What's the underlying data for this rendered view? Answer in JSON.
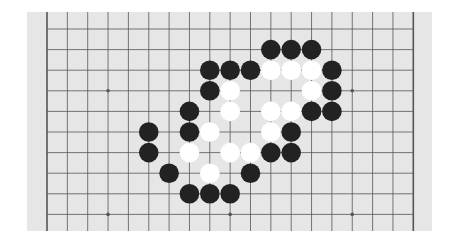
{
  "board": {
    "type": "go-diagram",
    "columns_visible": 19,
    "rows_visible": 10,
    "edges": {
      "left": true,
      "right": true,
      "top": false,
      "bottom": false
    },
    "colors": {
      "board": "#e6e6e6",
      "line": "#555555",
      "black_stone": "#222222",
      "white_stone": "#ffffff"
    },
    "star_points": [
      [
        3,
        3
      ],
      [
        15,
        3
      ],
      [
        3,
        9
      ],
      [
        9,
        9
      ],
      [
        15,
        9
      ]
    ],
    "stones": {
      "black": [
        [
          11,
          1
        ],
        [
          12,
          1
        ],
        [
          13,
          1
        ],
        [
          8,
          2
        ],
        [
          9,
          2
        ],
        [
          10,
          2
        ],
        [
          14,
          2
        ],
        [
          8,
          3
        ],
        [
          14,
          3
        ],
        [
          7,
          4
        ],
        [
          13,
          4
        ],
        [
          14,
          4
        ],
        [
          5,
          5
        ],
        [
          7,
          5
        ],
        [
          12,
          5
        ],
        [
          5,
          6
        ],
        [
          11,
          6
        ],
        [
          12,
          6
        ],
        [
          6,
          7
        ],
        [
          10,
          7
        ],
        [
          7,
          8
        ],
        [
          8,
          8
        ],
        [
          9,
          8
        ]
      ],
      "white": [
        [
          11,
          2
        ],
        [
          12,
          2
        ],
        [
          13,
          2
        ],
        [
          9,
          3
        ],
        [
          13,
          3
        ],
        [
          9,
          4
        ],
        [
          11,
          4
        ],
        [
          12,
          4
        ],
        [
          8,
          5
        ],
        [
          11,
          5
        ],
        [
          7,
          6
        ],
        [
          9,
          6
        ],
        [
          10,
          6
        ],
        [
          8,
          7
        ]
      ]
    }
  }
}
